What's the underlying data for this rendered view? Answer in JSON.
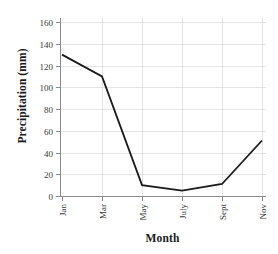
{
  "chart_data": {
    "type": "line",
    "title": "",
    "xlabel": "Month",
    "ylabel": "Precipitation (mm)",
    "categories": [
      "Jan",
      "Mar",
      "May",
      "July",
      "Sept",
      "Nov"
    ],
    "values": [
      130,
      110,
      10,
      5,
      11,
      51
    ],
    "series": [
      {
        "name": "Precipitation",
        "values": [
          130,
          110,
          10,
          5,
          11,
          51
        ]
      }
    ],
    "xlim": [
      0,
      5
    ],
    "ylim": [
      0,
      168
    ],
    "ytick_labels": [
      "0",
      "20",
      "40",
      "60",
      "80",
      "100",
      "120",
      "140",
      "160"
    ],
    "ytick_values": [
      0,
      20,
      40,
      60,
      80,
      100,
      120,
      140,
      160
    ],
    "xtick_labels": [
      "Jan",
      "Mar",
      "May",
      "July",
      "Sept",
      "Nov"
    ],
    "grid": true,
    "grid_color": "#d8d8d8",
    "legend": false,
    "legend_position": "none",
    "line_color": "#1a1a1a",
    "background_color": "#ffffff",
    "axis_color": "#8a8a8a",
    "xtick_label_rotation": 90
  },
  "axes": {
    "y_title": "Precipitation (mm)",
    "x_title": "Month"
  }
}
